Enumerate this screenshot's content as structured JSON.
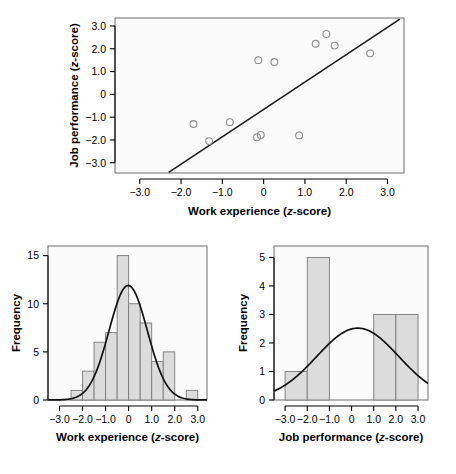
{
  "figure": {
    "background": "#ffffff",
    "panel_background": "#fbfbfb",
    "bar_fill": "#dcdcdc",
    "bar_stroke": "#7a7a7a",
    "point_stroke": "#8c8c8c",
    "line_color": "#1a1a1a"
  },
  "chart_data": [
    {
      "type": "scatter",
      "name": "scatter-work-experience-vs-job-performance",
      "title": "",
      "xlabel": "Work experience (z-score)",
      "ylabel": "Job performance (z-score)",
      "xlabel_parts": {
        "main": "Work experience (",
        "italic": "z",
        "tail": "-score)"
      },
      "ylabel_parts": {
        "main": "Job performance (",
        "italic": "z",
        "tail": "-score)"
      },
      "xlim": [
        -3.6,
        3.4
      ],
      "ylim": [
        -3.45,
        3.35
      ],
      "xticks": [
        -3.0,
        -2.0,
        -1.0,
        0,
        1.0,
        2.0,
        3.0
      ],
      "xtick_labels": [
        "-3.0",
        "-2.0",
        "-1.0",
        "0",
        "1.0",
        "2.0",
        "3.0"
      ],
      "yticks": [
        3.0,
        2.0,
        1.0,
        0,
        -1.0,
        -2.0,
        -3.0
      ],
      "ytick_labels": [
        "3.0",
        "2.0",
        "1.0",
        "0",
        "-1.0",
        "-2.0",
        "-3.0"
      ],
      "grid": false,
      "legend": "none",
      "points": [
        {
          "x": -1.7,
          "y": -1.3
        },
        {
          "x": -1.32,
          "y": -2.05
        },
        {
          "x": -0.82,
          "y": -1.22
        },
        {
          "x": -0.16,
          "y": -1.88
        },
        {
          "x": -0.07,
          "y": -1.78
        },
        {
          "x": -0.13,
          "y": 1.5
        },
        {
          "x": 0.26,
          "y": 1.42
        },
        {
          "x": 0.86,
          "y": -1.8
        },
        {
          "x": 1.26,
          "y": 2.22
        },
        {
          "x": 1.52,
          "y": 2.65
        },
        {
          "x": 1.72,
          "y": 2.14
        },
        {
          "x": 2.58,
          "y": 1.8
        }
      ],
      "regression_line": {
        "x0": -2.3,
        "y0": -3.42,
        "x1": 3.3,
        "y1": 3.3,
        "slope": 1.2,
        "intercept": -0.66
      }
    },
    {
      "type": "bar",
      "name": "histogram-work-experience",
      "title": "",
      "xlabel": "Work experience (z-score)",
      "ylabel": "Frequency",
      "xlabel_parts": {
        "main": "Work experience (",
        "italic": "z",
        "tail": "-score)"
      },
      "xlim": [
        -3.5,
        3.4
      ],
      "ylim": [
        0,
        16
      ],
      "xticks": [
        -3.0,
        -2.0,
        -1.0,
        0,
        1.0,
        2.0,
        3.0
      ],
      "xtick_labels": [
        "-3.0",
        "-2.0",
        "-1.0",
        "0",
        "1.0",
        "2.0",
        "3.0"
      ],
      "yticks": [
        0,
        5,
        10,
        15
      ],
      "ytick_labels": [
        "0",
        "5",
        "10",
        "15"
      ],
      "grid": false,
      "legend": "none",
      "bin_width": 0.5,
      "bins": [
        {
          "start": -2.5,
          "end": -2.0,
          "value": 1
        },
        {
          "start": -2.0,
          "end": -1.5,
          "value": 3
        },
        {
          "start": -1.5,
          "end": -1.0,
          "value": 6
        },
        {
          "start": -1.0,
          "end": -0.5,
          "value": 7
        },
        {
          "start": -0.5,
          "end": 0.0,
          "value": 15
        },
        {
          "start": 0.0,
          "end": 0.5,
          "value": 10
        },
        {
          "start": 0.5,
          "end": 1.0,
          "value": 8
        },
        {
          "start": 1.0,
          "end": 1.5,
          "value": 4
        },
        {
          "start": 1.5,
          "end": 2.0,
          "value": 5
        },
        {
          "start": 2.5,
          "end": 3.0,
          "value": 1
        }
      ],
      "normal_curve": {
        "peak": 11.9,
        "mean": -0.02,
        "sd": 0.83
      }
    },
    {
      "type": "bar",
      "name": "histogram-job-performance",
      "title": "",
      "xlabel": "Job performance (z-score)",
      "ylabel": "Frequency",
      "xlabel_parts": {
        "main": "Job performance (",
        "italic": "z",
        "tail": "-score)"
      },
      "xlim": [
        -3.5,
        3.45
      ],
      "ylim": [
        0,
        5.4
      ],
      "xticks": [
        -3.0,
        -2.0,
        -1.0,
        0,
        1.0,
        2.0,
        3.0
      ],
      "xtick_labels": [
        "-3.0",
        "-2.0",
        "-1.0",
        "0",
        "1.0",
        "2.0",
        "3.0"
      ],
      "yticks": [
        0,
        1,
        2,
        3,
        4,
        5
      ],
      "ytick_labels": [
        "0",
        "1",
        "2",
        "3",
        "4",
        "5"
      ],
      "grid": false,
      "legend": "none",
      "bin_width": 1.0,
      "bins": [
        {
          "start": -3.0,
          "end": -2.0,
          "value": 1
        },
        {
          "start": -2.0,
          "end": -1.0,
          "value": 5
        },
        {
          "start": 1.0,
          "end": 2.0,
          "value": 3
        },
        {
          "start": 2.0,
          "end": 3.0,
          "value": 3
        }
      ],
      "normal_curve": {
        "peak": 2.52,
        "mean": 0.28,
        "sd": 1.85
      }
    }
  ]
}
